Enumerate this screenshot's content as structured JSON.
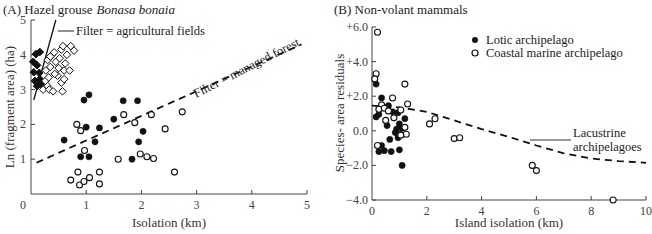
{
  "chart_data": [
    {
      "type": "scatter",
      "panel": "A",
      "title": "(A) Hazel grouse",
      "title_species": "Bonasa bonaia",
      "xlabel": "Isolation (km)",
      "ylabel": "Ln (fragment area) (ha)",
      "xlim": [
        0,
        5
      ],
      "ylim": [
        0,
        5
      ],
      "xticks": [
        "0",
        "1",
        "2",
        "3",
        "4",
        "5"
      ],
      "yticks": [
        "1",
        "2",
        "3",
        "4",
        "5"
      ],
      "grid": false,
      "series": [
        {
          "name": "filled-diamonds",
          "marker": "diamond-filled",
          "points": [
            [
              0.09,
              4.02
            ],
            [
              0.16,
              4.08
            ],
            [
              0.04,
              3.8
            ],
            [
              0.11,
              3.7
            ],
            [
              0.05,
              3.5
            ],
            [
              0.15,
              3.48
            ],
            [
              0.07,
              3.25
            ],
            [
              0.16,
              3.3
            ],
            [
              0.11,
              3.1
            ],
            [
              0.18,
              3.16
            ]
          ]
        },
        {
          "name": "open-diamonds",
          "marker": "diamond-open",
          "points": [
            [
              0.22,
              3.0
            ],
            [
              0.26,
              3.25
            ],
            [
              0.3,
              3.1
            ],
            [
              0.33,
              3.0
            ],
            [
              0.27,
              3.55
            ],
            [
              0.3,
              3.85
            ],
            [
              0.35,
              3.65
            ],
            [
              0.38,
              4.0
            ],
            [
              0.42,
              4.07
            ],
            [
              0.45,
              3.8
            ],
            [
              0.5,
              3.62
            ],
            [
              0.48,
              3.4
            ],
            [
              0.43,
              3.45
            ],
            [
              0.52,
              3.9
            ],
            [
              0.55,
              4.15
            ],
            [
              0.58,
              4.25
            ],
            [
              0.6,
              3.55
            ],
            [
              0.62,
              3.75
            ],
            [
              0.65,
              4.0
            ],
            [
              0.7,
              3.55
            ],
            [
              0.72,
              4.25
            ],
            [
              0.78,
              4.12
            ],
            [
              0.55,
              3.2
            ],
            [
              0.4,
              2.95
            ],
            [
              0.57,
              2.95
            ],
            [
              0.32,
              3.35
            ],
            [
              0.6,
              3.3
            ],
            [
              0.35,
              3.95
            ]
          ]
        },
        {
          "name": "filled-circles",
          "marker": "circle-filled",
          "points": [
            [
              0.96,
              2.7
            ],
            [
              1.05,
              2.85
            ],
            [
              1.67,
              2.68
            ],
            [
              1.93,
              2.68
            ],
            [
              1.5,
              2.15
            ],
            [
              0.6,
              1.55
            ],
            [
              1.0,
              1.92
            ],
            [
              1.24,
              1.9
            ],
            [
              1.16,
              1.5
            ],
            [
              0.9,
              1.07
            ],
            [
              1.05,
              1.07
            ],
            [
              2.03,
              1.8
            ],
            [
              1.95,
              1.5
            ],
            [
              1.83,
              1.0
            ]
          ]
        },
        {
          "name": "open-circles",
          "marker": "circle-open",
          "points": [
            [
              0.83,
              2.0
            ],
            [
              1.68,
              2.28
            ],
            [
              2.18,
              2.28
            ],
            [
              1.88,
              2.05
            ],
            [
              0.9,
              1.82
            ],
            [
              0.97,
              1.25
            ],
            [
              1.58,
              1.0
            ],
            [
              1.98,
              1.15
            ],
            [
              2.1,
              1.07
            ],
            [
              2.22,
              1.02
            ],
            [
              2.43,
              1.87
            ],
            [
              2.74,
              2.36
            ],
            [
              2.6,
              0.63
            ],
            [
              0.85,
              0.63
            ],
            [
              0.72,
              0.4
            ],
            [
              0.88,
              0.26
            ],
            [
              0.96,
              0.36
            ],
            [
              1.06,
              0.47
            ],
            [
              1.24,
              0.63
            ],
            [
              1.24,
              0.29
            ]
          ]
        }
      ],
      "lines": [
        {
          "name": "agricultural-filter",
          "style": "solid",
          "points": [
            [
              0.05,
              2.7
            ],
            [
              0.45,
              5.0
            ]
          ]
        },
        {
          "name": "managed-forest-filter",
          "style": "dashed",
          "points": [
            [
              0.1,
              0.9
            ],
            [
              4.9,
              4.3
            ]
          ]
        }
      ],
      "annotations": [
        {
          "text": "Filter = agricultural fields"
        },
        {
          "text": "Filter = managed forest"
        }
      ]
    },
    {
      "type": "scatter",
      "panel": "B",
      "title": "(B) Non-volant mammals",
      "xlabel": "Island isolation (km)",
      "ylabel": "Species- area residuals",
      "xlim": [
        0,
        10
      ],
      "ylim": [
        -4,
        6
      ],
      "xticks": [
        "0",
        "2",
        "4",
        "6",
        "8",
        "10"
      ],
      "yticks": [
        "+6.0",
        "+4.0",
        "+2.0",
        "0.0",
        "−2.0",
        "−4.0"
      ],
      "grid": false,
      "legend": {
        "placement": "top-right",
        "entries": [
          {
            "label": "Lotic archipelago",
            "marker": "circle-filled"
          },
          {
            "label": "Coastal marine archipelago",
            "marker": "circle-open"
          }
        ]
      },
      "series": [
        {
          "name": "Lotic archipelago",
          "marker": "circle-filled",
          "points": [
            [
              0.15,
              2.7
            ],
            [
              0.35,
              1.9
            ],
            [
              0.6,
              1.45
            ],
            [
              0.5,
              1.35
            ],
            [
              0.25,
              0.95
            ],
            [
              0.75,
              1.1
            ],
            [
              0.95,
              1.05
            ],
            [
              1.0,
              0.4
            ],
            [
              0.55,
              0.3
            ],
            [
              1.1,
              0.15
            ],
            [
              1.2,
              0.7
            ],
            [
              0.85,
              -0.1
            ],
            [
              0.65,
              -0.5
            ],
            [
              1.05,
              -0.2
            ],
            [
              0.35,
              -0.85
            ],
            [
              0.95,
              -0.4
            ],
            [
              0.25,
              -1.2
            ],
            [
              0.45,
              -1.15
            ],
            [
              0.7,
              -1.2
            ],
            [
              1.0,
              -1.1
            ],
            [
              1.1,
              -2.0
            ],
            [
              0.15,
              0.8
            ],
            [
              0.9,
              0.1
            ]
          ]
        },
        {
          "name": "Coastal marine archipelago",
          "marker": "circle-open",
          "points": [
            [
              0.2,
              5.7
            ],
            [
              0.15,
              3.3
            ],
            [
              0.1,
              3.0
            ],
            [
              0.35,
              1.5
            ],
            [
              0.25,
              1.25
            ],
            [
              0.45,
              1.3
            ],
            [
              0.75,
              1.9
            ],
            [
              1.2,
              2.7
            ],
            [
              1.3,
              1.55
            ],
            [
              1.05,
              1.2
            ],
            [
              0.6,
              1.15
            ],
            [
              0.8,
              0.75
            ],
            [
              1.2,
              0.2
            ],
            [
              1.25,
              -0.2
            ],
            [
              1.05,
              -0.25
            ],
            [
              0.2,
              -0.85
            ],
            [
              0.5,
              0.6
            ],
            [
              2.1,
              0.4
            ],
            [
              2.3,
              0.7
            ],
            [
              3.0,
              -0.45
            ],
            [
              3.2,
              -0.4
            ],
            [
              5.85,
              -2.0
            ],
            [
              6.0,
              -2.3
            ],
            [
              8.8,
              -4.0
            ]
          ]
        }
      ],
      "lines": [
        {
          "name": "lacustrine-curve",
          "style": "dashed",
          "points": [
            [
              0.0,
              1.45
            ],
            [
              1.0,
              1.35
            ],
            [
              2.0,
              1.1
            ],
            [
              3.0,
              0.6
            ],
            [
              4.0,
              0.1
            ],
            [
              5.0,
              -0.35
            ],
            [
              6.0,
              -0.85
            ],
            [
              7.0,
              -1.3
            ],
            [
              8.0,
              -1.6
            ],
            [
              9.0,
              -1.75
            ],
            [
              10.0,
              -1.85
            ]
          ]
        }
      ],
      "annotations": [
        {
          "text_line1": "Lacustrine",
          "text_line2": "archipelagoes"
        }
      ]
    }
  ]
}
